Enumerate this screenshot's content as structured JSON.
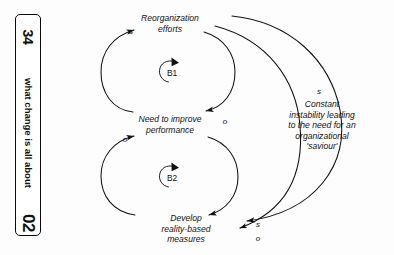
{
  "sidebar": {
    "number": "34",
    "title": "what change is all about",
    "chapter": "02"
  },
  "diagram": {
    "type": "causal-loop-diagram",
    "nodes": [
      {
        "id": "reorganization",
        "label": "Reorganization\nefforts"
      },
      {
        "id": "need-improve",
        "label": "Need to improve\nperformance"
      },
      {
        "id": "develop-measures",
        "label": "Develop\nreality-based\nmeasures"
      }
    ],
    "loops": [
      {
        "id": "B1",
        "label": "B1",
        "kind": "balancing"
      },
      {
        "id": "B2",
        "label": "B2",
        "kind": "balancing"
      }
    ],
    "links": [
      {
        "from": "need-improve",
        "to": "reorganization",
        "polarity": "s"
      },
      {
        "from": "reorganization",
        "to": "need-improve",
        "polarity": "o"
      },
      {
        "from": "develop-measures",
        "to": "need-improve",
        "polarity": "o"
      },
      {
        "from": "reorganization",
        "to": "develop-measures",
        "polarity": "s"
      },
      {
        "from": "reorganization",
        "to": "develop-measures",
        "polarity": "o"
      }
    ],
    "polarity_labels": {
      "top_left_s": "s",
      "top_right_o": "o",
      "bottom_left_o": "o",
      "outer_s": "s",
      "outer_bottom_s": "s",
      "outer_bottom_o": "o"
    },
    "annotation": "Constant instability leading\nto the need for an\norganizational 'saviour'"
  },
  "colors": {
    "ink": "#111111",
    "page": "#fdfdfd",
    "border": "#0a0a0a"
  }
}
